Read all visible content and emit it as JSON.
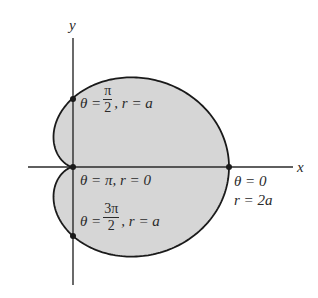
{
  "diagram": {
    "colors": {
      "fill": "#d6d6d6",
      "stroke": "#1a1a1a",
      "axis": "#2a2a2a",
      "background": "#ffffff"
    },
    "geometry": {
      "origin": [
        73,
        167
      ],
      "scale_x": 78,
      "scale_y": 69,
      "x_axis_range": [
        28,
        293
      ],
      "y_axis_range": [
        38,
        285
      ]
    },
    "axes": {
      "x_label": "x",
      "y_label": "y"
    },
    "points": [
      {
        "name": "theta-pi-over-2",
        "theta": "π/2",
        "r": "a",
        "xy": [
          73,
          99
        ]
      },
      {
        "name": "theta-pi",
        "theta": "π",
        "r": "0",
        "xy": [
          73,
          167
        ]
      },
      {
        "name": "theta-3pi-over-2",
        "theta": "3π/2",
        "r": "a",
        "xy": [
          73,
          236
        ]
      },
      {
        "name": "theta-0",
        "theta": "0",
        "r": "2a",
        "xy": [
          229,
          167
        ]
      }
    ],
    "labels": {
      "p1": {
        "theta": "θ =",
        "num": "π",
        "den": "2",
        "rest": ", r = a"
      },
      "p2": {
        "text": "θ = π, r = 0"
      },
      "p3": {
        "theta": "θ =",
        "num": "3π",
        "den": "2",
        "rest": ", r = a"
      },
      "p4": {
        "line1": "θ = 0",
        "line2": "r = 2a"
      }
    }
  }
}
